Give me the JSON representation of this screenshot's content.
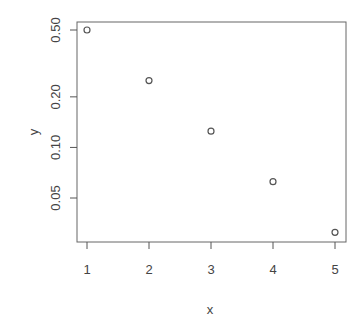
{
  "chart_data": {
    "type": "scatter",
    "title": "",
    "xlabel": "x",
    "ylabel": "y",
    "x": [
      1,
      2,
      3,
      4,
      5
    ],
    "y": [
      0.5,
      0.25,
      0.125,
      0.0625,
      0.03125
    ],
    "xlim": [
      0.85,
      5.15
    ],
    "ylim": [
      0.028,
      0.56
    ],
    "y_scale": "log",
    "x_ticks": [
      "1",
      "2",
      "3",
      "4",
      "5"
    ],
    "y_ticks": [
      "0.05",
      "0.10",
      "0.20",
      "0.50"
    ],
    "grid": false,
    "legend": null,
    "marker": "open-circle"
  },
  "colors": {
    "axis": "#555555",
    "marker": "#555555",
    "text": "#444444"
  }
}
